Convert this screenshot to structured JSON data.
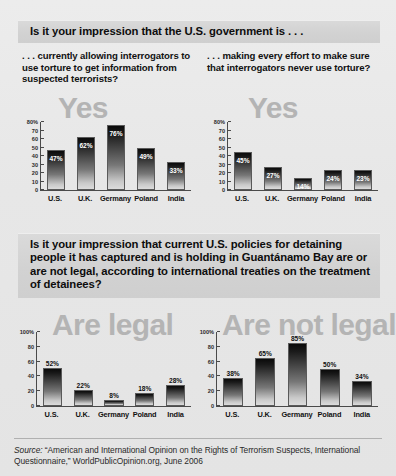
{
  "questions": {
    "q1": "Is it your impression that the U.S. government is . . .",
    "q2": "Is it your impression that current U.S. policies for detaining people it has captured and is holding in Guantánamo Bay are or are not legal, according to international treaties on the treatment of detainees?"
  },
  "subquestions": {
    "q1_left": ". . . currently allowing interrogators to use torture to get information from suspected terrorists?",
    "q1_right": ". . . making every effort to make sure that interrogators never use torture?"
  },
  "watermarks": {
    "yes_left": "Yes",
    "yes_right": "Yes",
    "are_legal": "Are legal",
    "are_not_legal": "Are not legal"
  },
  "source": {
    "label": "Source:",
    "text": " “American and International Opinion on the Rights of Terrorism Suspects, International Questionnaire,” WorldPublicOpinion.org, June 2006"
  },
  "colors": {
    "background": "#e9e9e9",
    "band": "#d2d2d2",
    "watermark": "#b4b4b4",
    "bar_top": "#0a0a0a",
    "bar_bottom": "#dcdcdc",
    "axis": "#4a4a4a"
  },
  "chart_data": [
    {
      "id": "allowing-torture-yes",
      "type": "bar",
      "title": "Yes",
      "xlabel": "",
      "ylabel": "",
      "ylim": [
        0,
        80
      ],
      "yticks": [
        "80%",
        "70",
        "60",
        "50",
        "40",
        "30",
        "20",
        "10",
        "0"
      ],
      "ytick_values": [
        80,
        70,
        60,
        50,
        40,
        30,
        20,
        10,
        0
      ],
      "grid": false,
      "label_position": "inside",
      "categories": [
        "U.S.",
        "U.K.",
        "Germany",
        "Poland",
        "India"
      ],
      "values": [
        47,
        62,
        76,
        49,
        33
      ],
      "value_labels": [
        "47%",
        "62%",
        "76%",
        "49%",
        "33%"
      ]
    },
    {
      "id": "never-use-torture-yes",
      "type": "bar",
      "title": "Yes",
      "xlabel": "",
      "ylabel": "",
      "ylim": [
        0,
        80
      ],
      "yticks": [
        "80%",
        "70",
        "60",
        "50",
        "40",
        "30",
        "20",
        "10",
        "0"
      ],
      "ytick_values": [
        80,
        70,
        60,
        50,
        40,
        30,
        20,
        10,
        0
      ],
      "grid": false,
      "label_position": "inside",
      "categories": [
        "U.S.",
        "U.K.",
        "Germany",
        "Poland",
        "India"
      ],
      "values": [
        45,
        27,
        14,
        24,
        23
      ],
      "value_labels": [
        "45%",
        "27%",
        "14%",
        "24%",
        "23%"
      ]
    },
    {
      "id": "guantanamo-are-legal",
      "type": "bar",
      "title": "Are legal",
      "xlabel": "",
      "ylabel": "",
      "ylim": [
        0,
        100
      ],
      "yticks": [
        "100%",
        "80",
        "60",
        "40",
        "20",
        "0"
      ],
      "ytick_values": [
        100,
        80,
        60,
        40,
        20,
        0
      ],
      "grid": false,
      "label_position": "outside",
      "categories": [
        "U.S.",
        "U.K.",
        "Germany",
        "Poland",
        "India"
      ],
      "values": [
        52,
        22,
        8,
        18,
        28
      ],
      "value_labels": [
        "52%",
        "22%",
        "8%",
        "18%",
        "28%"
      ]
    },
    {
      "id": "guantanamo-are-not-legal",
      "type": "bar",
      "title": "Are not legal",
      "xlabel": "",
      "ylabel": "",
      "ylim": [
        0,
        100
      ],
      "yticks": [
        "100%",
        "80",
        "60",
        "40",
        "20",
        "0"
      ],
      "ytick_values": [
        100,
        80,
        60,
        40,
        20,
        0
      ],
      "grid": false,
      "label_position": "outside",
      "categories": [
        "U.S.",
        "U.K.",
        "Germany",
        "Poland",
        "India"
      ],
      "values": [
        38,
        65,
        85,
        50,
        34
      ],
      "value_labels": [
        "38%",
        "65%",
        "85%",
        "50%",
        "34%"
      ]
    }
  ]
}
